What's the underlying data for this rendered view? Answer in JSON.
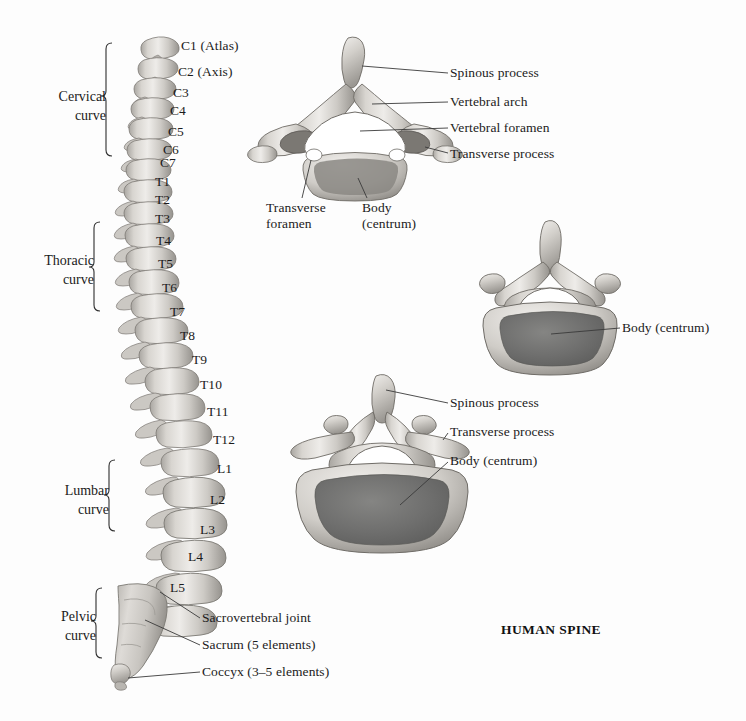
{
  "title": "HUMAN SPINE",
  "spine_column": {
    "region_braces": [
      {
        "name": "cervical",
        "label_line1": "Cervical",
        "label_line2": "curve"
      },
      {
        "name": "thoracic",
        "label_line1": "Thoracic",
        "label_line2": "curve"
      },
      {
        "name": "lumbar",
        "label_line1": "Lumbar",
        "label_line2": "curve"
      },
      {
        "name": "pelvic",
        "label_line1": "Pelvic",
        "label_line2": "curve"
      }
    ],
    "vertebra_labels": [
      {
        "id": "c1",
        "text": "C1 (Atlas)"
      },
      {
        "id": "c2",
        "text": "C2 (Axis)"
      },
      {
        "id": "c3",
        "text": "C3"
      },
      {
        "id": "c4",
        "text": "C4"
      },
      {
        "id": "c5",
        "text": "C5"
      },
      {
        "id": "c6",
        "text": "C6"
      },
      {
        "id": "c7",
        "text": "C7"
      },
      {
        "id": "t1",
        "text": "T1"
      },
      {
        "id": "t2",
        "text": "T2"
      },
      {
        "id": "t3",
        "text": "T3"
      },
      {
        "id": "t4",
        "text": "T4"
      },
      {
        "id": "t5",
        "text": "T5"
      },
      {
        "id": "t6",
        "text": "T6"
      },
      {
        "id": "t7",
        "text": "T7"
      },
      {
        "id": "t8",
        "text": "T8"
      },
      {
        "id": "t9",
        "text": "T9"
      },
      {
        "id": "t10",
        "text": "T10"
      },
      {
        "id": "t11",
        "text": "T11"
      },
      {
        "id": "t12",
        "text": "T12"
      },
      {
        "id": "l1",
        "text": "L1"
      },
      {
        "id": "l2",
        "text": "L2"
      },
      {
        "id": "l3",
        "text": "L3"
      },
      {
        "id": "l4",
        "text": "L4"
      },
      {
        "id": "l5",
        "text": "L5"
      }
    ],
    "callouts": [
      {
        "id": "sacrovertebral-joint",
        "text": "Sacrovertebral joint"
      },
      {
        "id": "sacrum",
        "text": "Sacrum (5 elements)"
      },
      {
        "id": "coccyx",
        "text": "Coccyx (3–5 elements)"
      }
    ]
  },
  "cervical_vertebra": {
    "name": "cervical-vertebra-superior-view",
    "callouts": [
      {
        "id": "spinous-process",
        "text": "Spinous process"
      },
      {
        "id": "vertebral-arch",
        "text": "Vertebral arch"
      },
      {
        "id": "vertebral-foramen",
        "text": "Vertebral foramen"
      },
      {
        "id": "transverse-process",
        "text": "Transverse process"
      },
      {
        "id": "transverse-foramen",
        "line1": "Transverse",
        "line2": "foramen"
      },
      {
        "id": "body-centrum",
        "line1": "Body",
        "line2": "(centrum)"
      }
    ]
  },
  "thoracic_vertebra": {
    "name": "thoracic-vertebra-superior-view",
    "callouts": [
      {
        "id": "body-centrum",
        "text": "Body (centrum)"
      }
    ]
  },
  "lumbar_vertebra": {
    "name": "lumbar-vertebra-superior-view",
    "callouts": [
      {
        "id": "spinous-process",
        "text": "Spinous process"
      },
      {
        "id": "transverse-process",
        "text": "Transverse process"
      },
      {
        "id": "body-centrum",
        "text": "Body (centrum)"
      }
    ]
  },
  "colors": {
    "bone_light": "#e3e0dc",
    "bone_mid": "#c2bfba",
    "bone_shadow": "#8f8c87",
    "centrum_fill": "#6f6f6f",
    "leader_line": "#3a3a3a",
    "text": "#1b1b1b",
    "background": "#fdfdfd"
  }
}
